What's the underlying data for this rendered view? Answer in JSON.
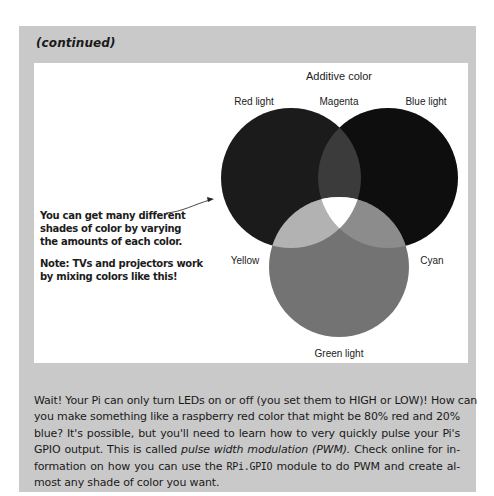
{
  "sidebar": {
    "heading": "(continued)",
    "background_color": "#c9c9c9"
  },
  "figure": {
    "title": "Additive color",
    "labels": {
      "red_light": "Red light",
      "magenta": "Magenta",
      "blue_light": "Blue light",
      "yellow": "Yellow",
      "cyan": "Cyan",
      "green_light": "Green light"
    },
    "circles": [
      {
        "name": "Red light",
        "cx": 291,
        "cy": 178,
        "r": 70,
        "fill": "#1b1b1b"
      },
      {
        "name": "Blue light",
        "cx": 388,
        "cy": 178,
        "r": 70,
        "fill": "#0e0e0e"
      },
      {
        "name": "Green light",
        "cx": 339,
        "cy": 267,
        "r": 70,
        "fill": "#737373"
      }
    ],
    "overlap_colors": {
      "magenta": "#3b3b3b",
      "yellow": "#b2b2b2",
      "cyan": "#8c8c8c",
      "white": "#ffffff"
    },
    "annotation": {
      "line1": "You can get many different",
      "line2": "shades of color by varying",
      "line3": "the amounts of each color.",
      "note1": "Note: TVs and projectors work",
      "note2": "by mixing colors like this!"
    }
  },
  "body": {
    "l1": "Wait! Your Pi can only turn LEDs on or off (you set them to HIGH or LOW)! How can",
    "l2": "you make something like a raspberry red color that might be 80% red and 20%",
    "l3": "blue? It's possible, but you'll need to learn how to very quickly pulse your Pi's",
    "l4a": "GPIO output. This is called ",
    "l4b": "pulse width modulation (PWM).",
    "l4c": " Check online for in-",
    "l5a": "formation on how you can use the ",
    "l5b": "RPi.GPIO",
    "l5c": " module to do PWM and create al-",
    "l6": "most any shade of color you want."
  }
}
